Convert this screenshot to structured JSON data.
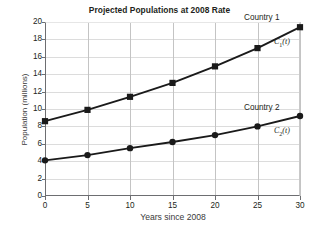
{
  "chart_data": {
    "type": "line",
    "title": "Projected Populations at 2008 Rate",
    "xlabel": "Years since 2008",
    "ylabel": "Population (millions)",
    "x": [
      0,
      5,
      10,
      15,
      20,
      25,
      30
    ],
    "xlim": [
      0,
      30
    ],
    "ylim": [
      0,
      20
    ],
    "xticks": [
      "0",
      "5",
      "10",
      "15",
      "20",
      "25",
      "30"
    ],
    "yticks": [
      "0",
      "2",
      "4",
      "6",
      "8",
      "10",
      "12",
      "14",
      "16",
      "18",
      "20"
    ],
    "grid": true,
    "legend_position": "inline-right",
    "series": [
      {
        "name": "Country 1",
        "function_label": "C",
        "function_sub": "1",
        "function_arg": "(t)",
        "marker": "square",
        "values": [
          8.6,
          9.9,
          11.4,
          13.0,
          14.9,
          17.0,
          19.4
        ]
      },
      {
        "name": "Country 2",
        "function_label": "C",
        "function_sub": "2",
        "function_arg": "(t)",
        "marker": "circle",
        "values": [
          4.1,
          4.7,
          5.5,
          6.2,
          7.0,
          8.0,
          9.2
        ]
      }
    ],
    "colors": {
      "line": "#1a1a1a",
      "grid": "#dcdcdc",
      "axis": "#6d6e71",
      "text": "#231f20",
      "background": "#ffffff"
    }
  }
}
